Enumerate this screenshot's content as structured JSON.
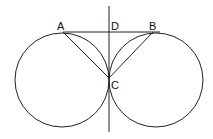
{
  "diagram": {
    "labels": {
      "A": "A",
      "B": "B",
      "C": "C",
      "D": "D"
    },
    "elements": [
      "left-circle",
      "right-circle",
      "vertical-line",
      "horizontal-segment-AB",
      "segment-AC",
      "segment-BC"
    ]
  }
}
